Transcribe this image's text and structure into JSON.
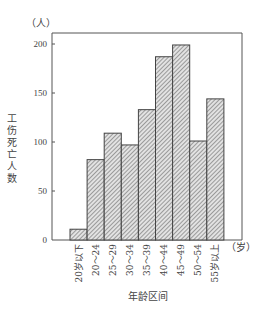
{
  "chart_data": {
    "type": "bar",
    "title": "",
    "xlabel": "年龄区间",
    "ylabel": "工伤死亡人数",
    "y_unit": "（人）",
    "x_unit": "（岁）",
    "categories": [
      "20岁以下",
      "20～24",
      "25～29",
      "30～34",
      "35～39",
      "40～44",
      "45～49",
      "50～54",
      "55岁以上"
    ],
    "values": [
      11,
      82,
      109,
      97,
      133,
      187,
      199,
      101,
      144
    ],
    "ylim": [
      0,
      200
    ],
    "yticks": [
      0,
      50,
      100,
      150,
      200
    ],
    "grid": false,
    "legend": null,
    "bar_fill": "hatched",
    "bar_color": "#555555"
  }
}
